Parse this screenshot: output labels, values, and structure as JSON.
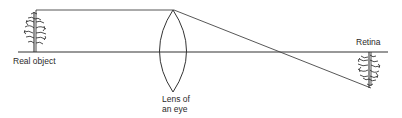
{
  "diagram": {
    "labels": {
      "object": "Real object",
      "lens_line1": "Lens of",
      "lens_line2": "an eye",
      "retina": "Retina"
    },
    "elements": [
      {
        "id": "real-object",
        "type": "upright tree",
        "position": "left, above optical axis"
      },
      {
        "id": "lens",
        "type": "biconvex lens",
        "position": "center-left"
      },
      {
        "id": "optical-axis",
        "type": "horizontal line"
      },
      {
        "id": "ray",
        "type": "light ray",
        "path": "from top of object parallel to axis to top of lens, then diagonally down to retina"
      },
      {
        "id": "retinal-image",
        "type": "inverted tree",
        "position": "right, below optical axis"
      }
    ],
    "colors": {
      "line": "#333333",
      "background": "#ffffff"
    }
  }
}
